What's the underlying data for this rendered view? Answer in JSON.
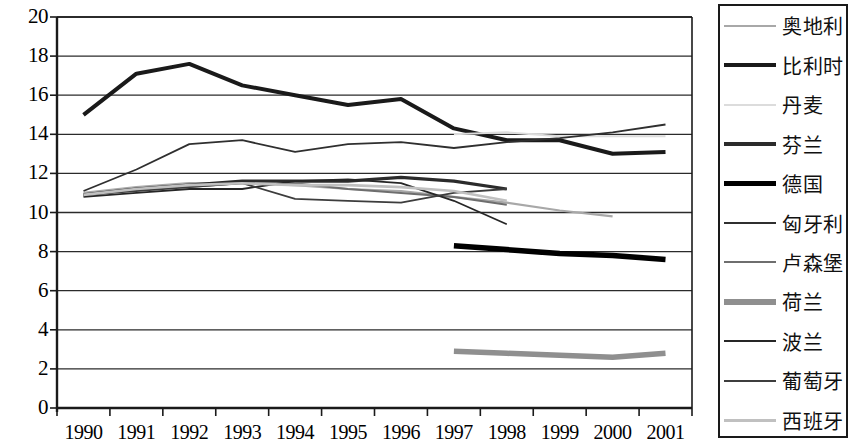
{
  "chart_data": {
    "type": "line",
    "title": "",
    "xlabel": "",
    "ylabel": "",
    "grid": true,
    "legend_position": "right",
    "categories": [
      "1990",
      "1991",
      "1992",
      "1993",
      "1994",
      "1995",
      "1996",
      "1997",
      "1998",
      "1999",
      "2000",
      "2001"
    ],
    "ylim": [
      0,
      20
    ],
    "yticks": [
      "0",
      "2",
      "4",
      "6",
      "8",
      "10",
      "12",
      "14",
      "16",
      "18",
      "20"
    ],
    "series": [
      {
        "name": "奥地利",
        "color": "#a8a8a8",
        "width": 2.2,
        "style": "solid",
        "values": [
          11.0,
          11.3,
          11.5,
          11.5,
          11.4,
          11.2,
          11.1,
          10.8,
          10.5,
          10.1,
          9.8,
          null
        ]
      },
      {
        "name": "比利时",
        "color": "#1a1a1a",
        "width": 4.0,
        "style": "solid",
        "values": [
          15.0,
          17.1,
          17.6,
          16.5,
          16.0,
          15.5,
          15.8,
          14.3,
          13.7,
          13.7,
          13.0,
          13.1
        ]
      },
      {
        "name": "丹麦",
        "color": "#dcdcdc",
        "width": 2.0,
        "style": "solid",
        "values": [
          null,
          null,
          null,
          null,
          null,
          null,
          null,
          14.0,
          14.1,
          13.9,
          13.9,
          13.9
        ]
      },
      {
        "name": "芬兰",
        "color": "#2b2b2b",
        "width": 3.2,
        "style": "solid",
        "values": [
          10.9,
          11.2,
          11.4,
          11.6,
          11.6,
          11.6,
          11.8,
          11.6,
          11.2,
          null,
          null,
          null
        ]
      },
      {
        "name": "德国",
        "color": "#000000",
        "width": 5.5,
        "style": "solid",
        "values": [
          null,
          null,
          null,
          null,
          null,
          null,
          null,
          8.3,
          8.1,
          7.9,
          7.8,
          7.6
        ]
      },
      {
        "name": "匈牙利",
        "color": "#2f2f2f",
        "width": 1.8,
        "style": "solid",
        "values": [
          11.1,
          12.2,
          13.5,
          13.7,
          13.1,
          13.5,
          13.6,
          13.3,
          13.6,
          13.8,
          14.1,
          14.5
        ]
      },
      {
        "name": "卢森堡",
        "color": "#6e6e6e",
        "width": 2.0,
        "style": "solid",
        "values": [
          10.9,
          11.2,
          11.3,
          11.5,
          11.5,
          11.2,
          11.0,
          10.8,
          10.4,
          null,
          null,
          null
        ]
      },
      {
        "name": "荷兰",
        "color": "#8f8f8f",
        "width": 5.5,
        "style": "solid",
        "values": [
          null,
          null,
          null,
          null,
          null,
          null,
          null,
          2.9,
          2.8,
          2.7,
          2.6,
          2.8
        ]
      },
      {
        "name": "波兰",
        "color": "#262626",
        "width": 1.8,
        "style": "solid",
        "values": [
          10.8,
          11.0,
          11.2,
          11.2,
          11.6,
          11.7,
          11.5,
          10.6,
          9.4,
          null,
          null,
          null
        ]
      },
      {
        "name": "葡萄牙",
        "color": "#3d3d3d",
        "width": 1.8,
        "style": "solid",
        "values": [
          10.9,
          11.1,
          11.3,
          11.5,
          10.7,
          10.6,
          10.5,
          11.0,
          11.2,
          null,
          null,
          null
        ]
      },
      {
        "name": "西班牙",
        "color": "#c0c0c0",
        "width": 2.6,
        "style": "solid",
        "values": [
          10.9,
          11.2,
          11.4,
          11.5,
          11.4,
          11.4,
          11.3,
          11.1,
          10.6,
          null,
          null,
          null
        ]
      }
    ]
  }
}
